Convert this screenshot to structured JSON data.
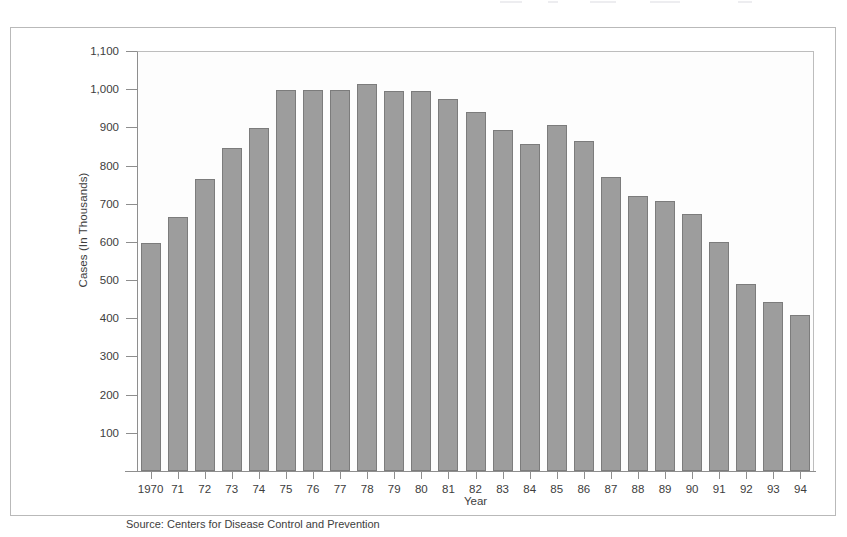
{
  "chart_data": {
    "type": "bar",
    "title": "",
    "subtitle": "",
    "xlabel": "Year",
    "ylabel": "Cases (In Thousands)",
    "categories": [
      "1970",
      "71",
      "72",
      "73",
      "74",
      "75",
      "76",
      "77",
      "78",
      "79",
      "80",
      "81",
      "82",
      "83",
      "84",
      "85",
      "86",
      "87",
      "88",
      "89",
      "90",
      "91",
      "92",
      "93",
      "94"
    ],
    "values": [
      598,
      665,
      765,
      845,
      898,
      997,
      997,
      997,
      1013,
      996,
      996,
      975,
      940,
      893,
      857,
      905,
      864,
      770,
      720,
      707,
      672,
      599,
      489,
      443,
      408
    ],
    "ylim": [
      0,
      1100
    ],
    "ytick_labels": [
      "1,100",
      "1,000",
      "900",
      "800",
      "700",
      "600",
      "500",
      "400",
      "300",
      "200",
      "100"
    ],
    "ytick_values": [
      1100,
      1000,
      900,
      800,
      700,
      600,
      500,
      400,
      300,
      200,
      100
    ],
    "grid": false,
    "legend": "none",
    "bar_color": "#9d9d9d",
    "bar_edge_color": "#7c7c7c",
    "axis_color": "#8e8e8e",
    "plot_background": "#fdfdfd",
    "frame_color": "#b9b9b9",
    "source_note": "Source: Centers for Disease Control and Prevention"
  }
}
